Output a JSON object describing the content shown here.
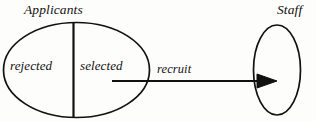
{
  "diagram": {
    "type": "entity-relationship-diagram",
    "background_color": "#fdfdfc",
    "stroke_color": "#111111",
    "entities": {
      "applicants": {
        "title": "Applicants",
        "shape": "ellipse",
        "partitions": [
          {
            "name": "rejected",
            "label": "rejected"
          },
          {
            "name": "selected",
            "label": "selected"
          }
        ]
      },
      "staff": {
        "title": "Staff",
        "shape": "ellipse"
      }
    },
    "relationships": [
      {
        "name": "recruit",
        "label": "recruit",
        "from": "selected",
        "to": "staff",
        "arrow": "filled-triangle"
      }
    ]
  }
}
